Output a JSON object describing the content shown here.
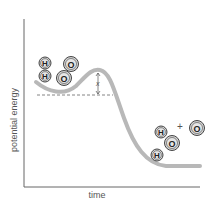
{
  "diagram": {
    "type": "energy-profile",
    "axes": {
      "ylabel": "potential energy",
      "xlabel": "time"
    },
    "barrier_label": "x",
    "reactants": {
      "molecules": [
        {
          "atoms": [
            "H",
            "H"
          ]
        },
        {
          "atoms": [
            "O",
            "O"
          ]
        }
      ]
    },
    "products": {
      "molecule": {
        "atoms": [
          "H",
          "O",
          "H"
        ]
      },
      "plus": "+",
      "single": {
        "atoms": [
          "O"
        ]
      }
    },
    "colors": {
      "curve": "#b8b8b8",
      "axis": "#555555",
      "atom_fill": "#d4d4d4",
      "atom_stroke": "#444444",
      "dashed": "#666666"
    }
  }
}
